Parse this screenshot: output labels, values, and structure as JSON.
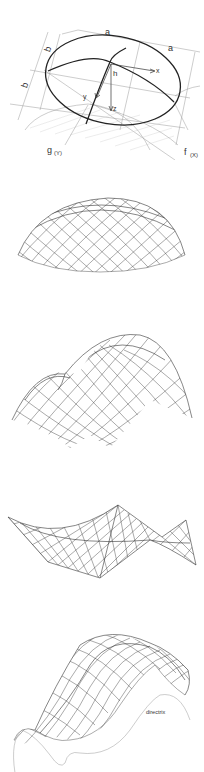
{
  "figures": [
    {
      "id": "elliptic-paraboloid-definition",
      "labels": {
        "a_top_left": "a",
        "a_top_right": "a",
        "b_upper": "b",
        "b_lower": "b",
        "h": "h",
        "x": "x",
        "y": "y",
        "z": "z",
        "g": "g",
        "g_sub": "(Y)",
        "f": "f",
        "f_sub": "(X)"
      }
    },
    {
      "id": "elliptic-dome-mesh"
    },
    {
      "id": "twin-vault-mesh"
    },
    {
      "id": "hyperbolic-paraboloid-mesh"
    },
    {
      "id": "translational-surface-mesh",
      "labels": {
        "directrix": "directrix"
      }
    }
  ],
  "colors": {
    "background": "#ffffff",
    "line_dark": "#222222",
    "line_light": "#9a9a9a",
    "text": "#333333"
  }
}
